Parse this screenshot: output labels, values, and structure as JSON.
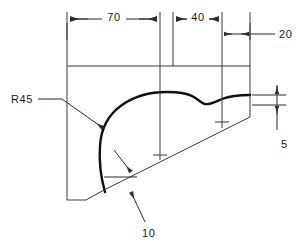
{
  "drawing": {
    "title": "engineering-part-outline-drawing",
    "background_color": "#ffffff",
    "line_color": "#3a3a3a",
    "profile_color": "#111111",
    "text_color": "#1a1a1a"
  },
  "dimensions": {
    "top_left": {
      "label": "70",
      "value": 70,
      "orientation": "horizontal"
    },
    "top_middle": {
      "label": "40",
      "value": 40,
      "orientation": "horizontal"
    },
    "top_right": {
      "label": "20",
      "value": 20,
      "orientation": "horizontal"
    },
    "right_vertical": {
      "label": "5",
      "value": 5,
      "orientation": "vertical"
    }
  },
  "annotations": {
    "radius": {
      "label": "R45",
      "value": 45,
      "type": "radius-leader"
    },
    "chamfer": {
      "label": "10",
      "value": 10,
      "type": "leader"
    }
  },
  "geometry": {
    "outline_points": "67,23 67,200 85,200 109,189 250,118 250,23",
    "inner_horizontal_line_y": 66,
    "center_marks": [
      {
        "x": 160,
        "y": 155
      },
      {
        "x": 222,
        "y": 122
      }
    ]
  }
}
